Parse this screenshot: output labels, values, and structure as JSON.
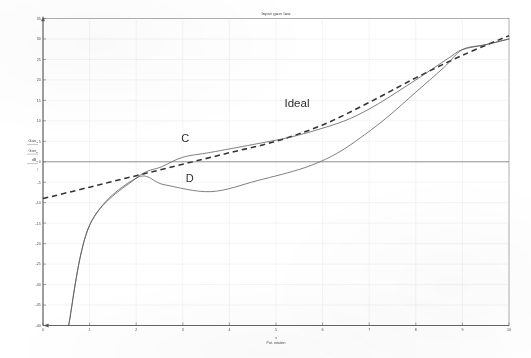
{
  "chart_data": {
    "type": "line",
    "title": "Input gain law",
    "xlabel_line1": "x",
    "xlabel_line2": "Pot. rotation",
    "ylabel_lines": [
      {
        "base": "Gain",
        "sub": "C"
      },
      {
        "base": "Gain",
        "sub": "D"
      },
      {
        "base": "dB",
        "sub": "id"
      },
      {
        "base": "/",
        "sub": ""
      }
    ],
    "xlim": [
      0,
      10
    ],
    "ylim": [
      -40,
      35
    ],
    "xticks": [
      0,
      1,
      2,
      3,
      4,
      5,
      6,
      7,
      8,
      9,
      10
    ],
    "xticklabels": [
      "0",
      "1",
      "2",
      "3",
      "4",
      "5",
      "6",
      "7",
      "8",
      "9",
      "10"
    ],
    "yticks": [
      35,
      30,
      25,
      20,
      15,
      10,
      5,
      0,
      -5,
      -10,
      -15,
      -20,
      -25,
      -30,
      -35,
      -40
    ],
    "yticklabels": [
      "35",
      "30",
      "25",
      "20",
      "15",
      "10",
      "5",
      "0",
      "-5",
      "-10",
      "-15",
      "-20",
      "-25",
      "-30",
      "-35",
      "-40"
    ],
    "grid": true,
    "legend": "none",
    "annotations": [
      {
        "text": "Ideal",
        "x": 5.45,
        "y": 13.5
      },
      {
        "text": "C",
        "x": 3.05,
        "y": 4.8
      },
      {
        "text": "D",
        "x": 3.15,
        "y": -5.0
      }
    ],
    "series": [
      {
        "name": "Ideal",
        "style": "dashed",
        "color": "#333333",
        "points": [
          [
            0.0,
            -9.0
          ],
          [
            1.0,
            -6.2
          ],
          [
            2.0,
            -3.4
          ],
          [
            3.0,
            -0.6
          ],
          [
            4.0,
            2.2
          ],
          [
            5.0,
            5.0
          ],
          [
            6.0,
            9.0
          ],
          [
            7.0,
            14.5
          ],
          [
            8.0,
            20.5
          ],
          [
            9.0,
            26.0
          ],
          [
            10.0,
            30.8
          ]
        ]
      },
      {
        "name": "C",
        "style": "solid",
        "color": "#555555",
        "points": [
          [
            0.55,
            -40.0
          ],
          [
            1.0,
            -15.5
          ],
          [
            2.0,
            -4.0
          ],
          [
            2.55,
            -1.2
          ],
          [
            3.0,
            1.1
          ],
          [
            3.6,
            2.3
          ],
          [
            4.5,
            4.2
          ],
          [
            5.3,
            6.0
          ],
          [
            6.0,
            8.2
          ],
          [
            6.6,
            10.6
          ],
          [
            7.2,
            14.2
          ],
          [
            8.0,
            20.0
          ],
          [
            8.7,
            25.3
          ],
          [
            9.0,
            27.4
          ],
          [
            9.5,
            28.6
          ],
          [
            10.0,
            30.0
          ]
        ]
      },
      {
        "name": "D",
        "style": "solid",
        "color": "#555555",
        "points": [
          [
            0.55,
            -40.0
          ],
          [
            1.0,
            -15.5
          ],
          [
            2.0,
            -4.0
          ],
          [
            2.6,
            -5.6
          ],
          [
            3.6,
            -7.3
          ],
          [
            4.6,
            -4.6
          ],
          [
            5.6,
            -1.5
          ],
          [
            6.3,
            2.0
          ],
          [
            6.9,
            6.6
          ],
          [
            7.4,
            11.0
          ],
          [
            8.0,
            17.0
          ],
          [
            8.6,
            23.0
          ],
          [
            9.0,
            27.4
          ],
          [
            9.5,
            28.6
          ],
          [
            10.0,
            30.0
          ]
        ]
      },
      {
        "name": "zero-baseline",
        "style": "solid-flat",
        "color": "#6a6a6a",
        "points": [
          [
            0.0,
            0.0
          ],
          [
            10.0,
            0.0
          ]
        ]
      }
    ]
  }
}
